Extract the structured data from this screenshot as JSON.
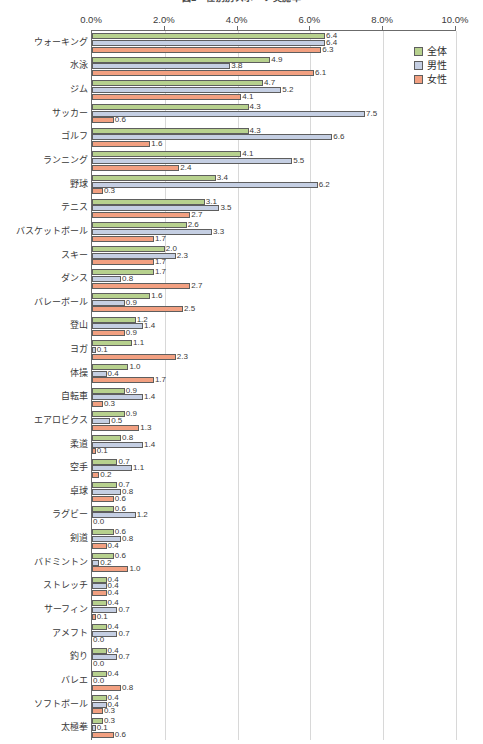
{
  "chart_data": {
    "type": "bar",
    "orientation": "horizontal",
    "title": "図2　性別別スポーツ実施率",
    "xlabel": "",
    "ylabel": "",
    "xlim": [
      0,
      10
    ],
    "xtick_labels": [
      "0.0%",
      "2.0%",
      "4.0%",
      "6.0%",
      "8.0%",
      "10.0%"
    ],
    "xtick_values": [
      0,
      2,
      4,
      6,
      8,
      10
    ],
    "grid": true,
    "legend_position": "top-right",
    "value_unit": "%",
    "categories": [
      "ウォーキング",
      "水泳",
      "ジム",
      "サッカー",
      "ゴルフ",
      "ランニング",
      "野球",
      "テニス",
      "バスケットボール",
      "スキー",
      "ダンス",
      "バレーボール",
      "登山",
      "ヨガ",
      "体操",
      "自転車",
      "エアロビクス",
      "柔道",
      "空手",
      "卓球",
      "ラグビー",
      "剣道",
      "バドミントン",
      "ストレッチ",
      "サーフィン",
      "アメフト",
      "釣り",
      "バレエ",
      "ソフトボール",
      "太極拳"
    ],
    "series": [
      {
        "name": "全体",
        "color": "#b7d18e",
        "values": [
          6.4,
          4.9,
          4.7,
          4.3,
          4.3,
          4.1,
          3.4,
          3.1,
          2.6,
          2.0,
          1.7,
          1.6,
          1.2,
          1.1,
          1.0,
          0.9,
          0.9,
          0.8,
          0.7,
          0.7,
          0.6,
          0.6,
          0.6,
          0.4,
          0.4,
          0.4,
          0.4,
          0.4,
          0.4,
          0.3
        ],
        "labels": [
          "6.4",
          "4.9",
          "4.7",
          "4.3",
          "4.3",
          "4.1",
          "3.4",
          "3.1",
          "2.6",
          "2.0",
          "1.7",
          "1.6",
          "1.2",
          "1.1",
          "1.0",
          "0.9",
          "0.9",
          "0.8",
          "0.7",
          "0.7",
          "0.6",
          "0.6",
          "0.6",
          "0.4",
          "0.4",
          "0.4",
          "0.4",
          "0.4",
          "0.4",
          "0.3"
        ]
      },
      {
        "name": "男性",
        "color": "#c5cfe3",
        "values": [
          6.4,
          3.8,
          5.2,
          7.5,
          6.6,
          5.5,
          6.2,
          3.5,
          3.3,
          2.3,
          0.8,
          0.9,
          1.4,
          0.1,
          0.4,
          1.4,
          0.5,
          1.4,
          1.1,
          0.8,
          1.2,
          0.8,
          0.2,
          0.4,
          0.7,
          0.7,
          0.7,
          0.0,
          0.4,
          0.1
        ],
        "labels": [
          "6.4",
          "3.8",
          "5.2",
          "7.5",
          "6.6",
          "5.5",
          "6.2",
          "3.5",
          "3.3",
          "2.3",
          "0.8",
          "0.9",
          "1.4",
          "0.1",
          "0.4",
          "1.4",
          "0.5",
          "1.4",
          "1.1",
          "0.8",
          "1.2",
          "0.8",
          "0.2",
          "0.4",
          "0.7",
          "0.7",
          "0.7",
          "0.0",
          "0.4",
          "0.1"
        ]
      },
      {
        "name": "女性",
        "color": "#f2a081",
        "values": [
          6.3,
          6.1,
          4.1,
          0.6,
          1.6,
          2.4,
          0.3,
          2.7,
          1.7,
          1.7,
          2.7,
          2.5,
          0.9,
          2.3,
          1.7,
          0.3,
          1.3,
          0.1,
          0.2,
          0.6,
          0.0,
          0.4,
          1.0,
          0.4,
          0.1,
          0.0,
          0.0,
          0.8,
          0.3,
          0.6
        ],
        "labels": [
          "6.3",
          "6.1",
          "4.1",
          "0.6",
          "1.6",
          "2.4",
          "0.3",
          "2.7",
          "1.7",
          "1.7",
          "2.7",
          "2.5",
          "0.9",
          "2.3",
          "1.7",
          "0.3",
          "1.3",
          "0.1",
          "0.2",
          "0.6",
          "0.0",
          "0.4",
          "1.0",
          "0.4",
          "0.1",
          "0.0",
          "0.0",
          "0.8",
          "0.3",
          "0.6"
        ]
      }
    ]
  },
  "legend": {
    "items": [
      {
        "label": "全体"
      },
      {
        "label": "男性"
      },
      {
        "label": "女性"
      }
    ]
  }
}
